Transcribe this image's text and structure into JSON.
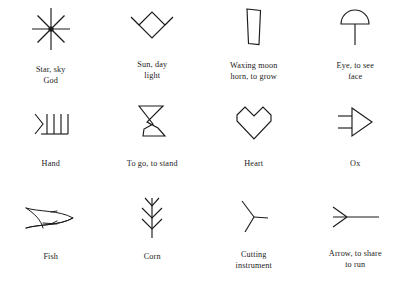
{
  "page": {
    "background_color": "#ffffff",
    "ink_color": "#1b1b1b",
    "columns": 4,
    "rows": 3
  },
  "symbols": [
    {
      "id": "star",
      "icon": "eight-ray-star-icon",
      "caption_line1": "Star, sky",
      "caption_line2": "God"
    },
    {
      "id": "sun",
      "icon": "diamond-sun-icon",
      "caption_line1": "Sun, day",
      "caption_line2": "light"
    },
    {
      "id": "waxing-moon",
      "icon": "tall-quadrilateral-moon-icon",
      "caption_line1": "Waxing moon",
      "caption_line2": "horn, to grow"
    },
    {
      "id": "eye",
      "icon": "dome-with-stem-eye-icon",
      "caption_line1": "Eye, to see",
      "caption_line2": "face"
    },
    {
      "id": "hand",
      "icon": "four-fingers-hand-icon",
      "caption_line1": "Hand",
      "caption_line2": ""
    },
    {
      "id": "to-go",
      "icon": "boot-leg-icon",
      "caption_line1": "To go, to stand",
      "caption_line2": ""
    },
    {
      "id": "heart",
      "icon": "angular-heart-icon",
      "caption_line1": "Heart",
      "caption_line2": ""
    },
    {
      "id": "ox",
      "icon": "triangle-horns-ox-icon",
      "caption_line1": "Ox",
      "caption_line2": ""
    },
    {
      "id": "fish",
      "icon": "fish-icon",
      "caption_line1": "Fish",
      "caption_line2": ""
    },
    {
      "id": "corn",
      "icon": "corn-stalk-icon",
      "caption_line1": "Corn",
      "caption_line2": ""
    },
    {
      "id": "cutting-instrument",
      "icon": "three-pronged-blade-icon",
      "caption_line1": "Cutting",
      "caption_line2": "instrument"
    },
    {
      "id": "arrow",
      "icon": "arrow-icon",
      "caption_line1": "Arrow, to share",
      "caption_line2": "to run"
    }
  ]
}
